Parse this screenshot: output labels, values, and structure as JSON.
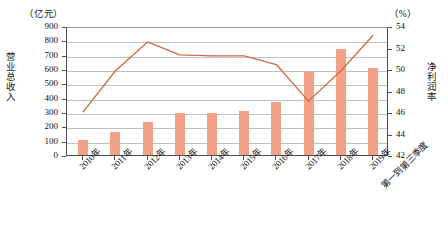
{
  "chart_data": {
    "type": "bar",
    "title": "",
    "subtitle": "",
    "categories": [
      "2010年",
      "2011年",
      "2012年",
      "2013年",
      "2014年",
      "2015年",
      "2016年",
      "2017年",
      "2018年",
      "2019年"
    ],
    "category_sublabel": "第一到第三季度",
    "xlabel": "",
    "grid": true,
    "legend": "none",
    "left_axis": {
      "label": "营业总收入",
      "unit": "（亿元）",
      "ylim": [
        0,
        900
      ],
      "ticks": [
        "0",
        "100",
        "200",
        "300",
        "400",
        "500",
        "600",
        "700",
        "800",
        "900"
      ],
      "tick_values": [
        0,
        100,
        200,
        300,
        400,
        500,
        600,
        700,
        800,
        900
      ]
    },
    "right_axis": {
      "label": "净利润率",
      "unit": "（%）",
      "ylim": [
        42,
        54
      ],
      "ticks": [
        "42",
        "44",
        "46",
        "48",
        "50",
        "52",
        "54"
      ],
      "tick_values": [
        42,
        44,
        46,
        48,
        50,
        52,
        54
      ]
    },
    "series": [
      {
        "name": "营业总收入",
        "type": "bar",
        "axis": "left",
        "color": "#f0a186",
        "values": [
          105,
          160,
          230,
          290,
          290,
          305,
          370,
          580,
          740,
          610
        ]
      },
      {
        "name": "净利润率",
        "type": "line",
        "axis": "right",
        "color": "#d2693f",
        "values": [
          46.2,
          50.0,
          52.7,
          51.5,
          51.4,
          51.4,
          50.6,
          47.2,
          50.0,
          53.3
        ]
      }
    ]
  }
}
